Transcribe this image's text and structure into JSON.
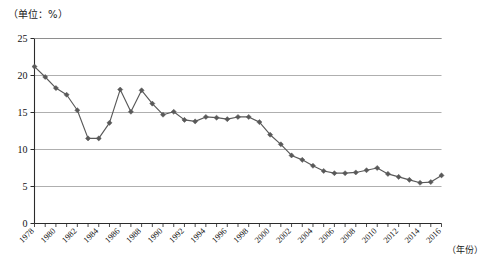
{
  "labels": {
    "unit": "（单位：%）",
    "xaxis_title": "（年份）"
  },
  "chart_data": {
    "type": "line",
    "title": "",
    "subtitle": "",
    "xlabel": "（年份）",
    "ylabel": "（单位：%）",
    "ylim": [
      0,
      25
    ],
    "ytick_step": 5,
    "ytick_labels": [
      "0",
      "5",
      "10",
      "15",
      "20",
      "25"
    ],
    "grid": true,
    "legend": "none",
    "marker": "diamond",
    "series_color": "#595959",
    "x": [
      1978,
      1979,
      1980,
      1981,
      1982,
      1983,
      1984,
      1985,
      1986,
      1987,
      1988,
      1989,
      1990,
      1991,
      1992,
      1993,
      1994,
      1995,
      1996,
      1997,
      1998,
      1999,
      2000,
      2001,
      2002,
      2003,
      2004,
      2005,
      2006,
      2007,
      2008,
      2009,
      2010,
      2011,
      2012,
      2013,
      2014,
      2015,
      2016
    ],
    "xtick_labels": [
      "1978",
      "1980",
      "1982",
      "1984",
      "1986",
      "1988",
      "1990",
      "1992",
      "1994",
      "1996",
      "1998",
      "2000",
      "2002",
      "2004",
      "2006",
      "2008",
      "2010",
      "2012",
      "2014",
      "2016"
    ],
    "values": [
      21.2,
      19.8,
      18.3,
      17.4,
      15.3,
      11.5,
      11.5,
      13.6,
      18.1,
      15.1,
      18.0,
      16.2,
      14.7,
      15.1,
      14.0,
      13.8,
      14.4,
      14.3,
      14.1,
      14.4,
      14.4,
      13.7,
      12.0,
      10.7,
      9.2,
      8.6,
      7.8,
      7.1,
      6.8,
      6.8,
      6.9,
      7.2,
      7.5,
      6.7,
      6.3,
      5.9,
      5.5,
      5.6,
      6.5
    ]
  }
}
